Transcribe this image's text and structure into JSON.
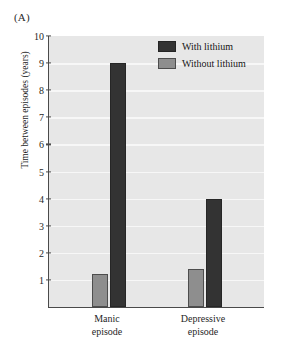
{
  "panel": {
    "label": "(A)"
  },
  "chart_data": {
    "type": "bar",
    "title": "",
    "subtitle": "",
    "panel_label": "(A)",
    "categories": [
      "Manic episode",
      "Depressive episode"
    ],
    "category_lines": [
      {
        "line1": "Manic",
        "line2": "episode"
      },
      {
        "line1": "Depressive",
        "line2": "episode"
      }
    ],
    "series": [
      {
        "name": "Without lithium",
        "color": "#8e8e8e",
        "values": [
          1.2,
          1.4
        ]
      },
      {
        "name": "With lithium",
        "color": "#333333",
        "values": [
          9.0,
          4.0
        ]
      }
    ],
    "xlabel": "",
    "ylabel": "Time between episodes (years)",
    "ylim": [
      0,
      10
    ],
    "ytick_values": [
      1,
      2,
      3,
      4,
      5,
      6,
      7,
      8,
      9,
      10
    ],
    "ytick_labels": [
      "1",
      "2",
      "3",
      "4",
      "5",
      "6",
      "7",
      "8",
      "9",
      "10"
    ],
    "grid": true,
    "grid_color": "#f7f7f7",
    "plot_background": "#e7e7e7",
    "legend_position": "top-right",
    "legend": [
      {
        "label": "With lithium",
        "color": "#333333"
      },
      {
        "label": "Without lithium",
        "color": "#8e8e8e"
      }
    ]
  }
}
